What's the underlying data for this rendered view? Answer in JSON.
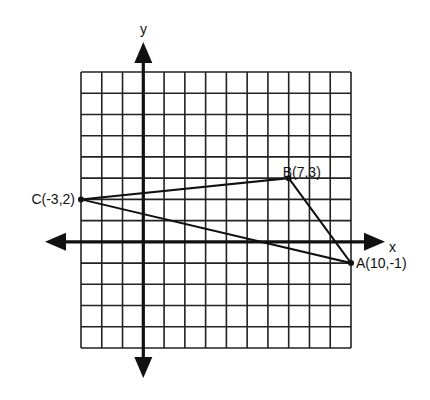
{
  "chart_data": {
    "type": "scatter",
    "title": "",
    "xlabel": "x",
    "ylabel": "y",
    "xlim": [
      -3,
      10
    ],
    "ylim": [
      -5,
      8
    ],
    "grid": true,
    "grid_step": 1,
    "legend": null,
    "points": [
      {
        "name": "A",
        "x": 10,
        "y": -1,
        "label": "A(10,-1)"
      },
      {
        "name": "B",
        "x": 7,
        "y": 3,
        "label": "B(7,3)"
      },
      {
        "name": "C",
        "x": -3,
        "y": 2,
        "label": "C(-3,2)"
      }
    ],
    "polygon": {
      "name": "triangle ABC",
      "vertices": [
        "A",
        "B",
        "C"
      ]
    }
  },
  "axes": {
    "x_label": "x",
    "y_label": "y"
  },
  "colors": {
    "line": "#111111",
    "grid": "#222222",
    "background": "#ffffff"
  }
}
